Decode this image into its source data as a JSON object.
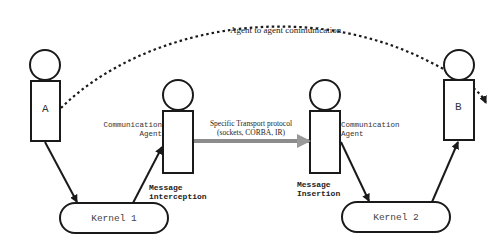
{
  "diagram": {
    "top_arc_label": "Agent to agent communication",
    "agent_a": {
      "label": "A"
    },
    "agent_b": {
      "label": "B"
    },
    "comm_agent_left": {
      "label_line1": "Communication",
      "label_line2": "Agent"
    },
    "comm_agent_right": {
      "label_line1": "Communication",
      "label_line2": "Agent"
    },
    "transport": {
      "line1": "Specific Transport protocol",
      "line2": "(sockets, CORBA, IR)"
    },
    "kernel1": {
      "label": "Kernel 1"
    },
    "kernel2": {
      "label": "Kernel 2"
    },
    "interception": {
      "line1": "Message",
      "line2": "interception"
    },
    "insertion": {
      "line1": "Message",
      "line2": "Insertion"
    },
    "colors": {
      "stroke": "#1a1a1a",
      "transport_arrow": "#8c8c8c",
      "background": "#ffffff"
    }
  }
}
